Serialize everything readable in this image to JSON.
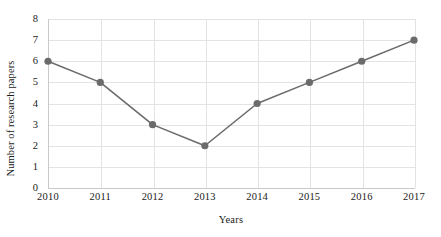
{
  "chart_data": {
    "type": "line",
    "title": "",
    "xlabel": "Years",
    "ylabel": "Number of research papers",
    "categories": [
      "2010",
      "2011",
      "2012",
      "2013",
      "2014",
      "2015",
      "2016",
      "2017"
    ],
    "x": [
      2010,
      2011,
      2012,
      2013,
      2014,
      2015,
      2016,
      2017
    ],
    "values": [
      6,
      5,
      3,
      2,
      4,
      5,
      6,
      7
    ],
    "series": [
      {
        "name": "Number of research papers",
        "values": [
          6,
          5,
          3,
          2,
          4,
          5,
          6,
          7
        ]
      }
    ],
    "ylim": [
      0,
      8
    ],
    "yticks": [
      "0",
      "1",
      "2",
      "3",
      "4",
      "5",
      "6",
      "7",
      "8"
    ],
    "ytick_values": [
      0,
      1,
      2,
      3,
      4,
      5,
      6,
      7,
      8
    ],
    "grid": "both",
    "legend": "none",
    "line_color": "#6b6b6b",
    "marker_color": "#6b6b6b",
    "marker": "circle",
    "grid_color": "#e3e3e3",
    "axis_color": "#c9c9c9",
    "background": "#ffffff"
  }
}
